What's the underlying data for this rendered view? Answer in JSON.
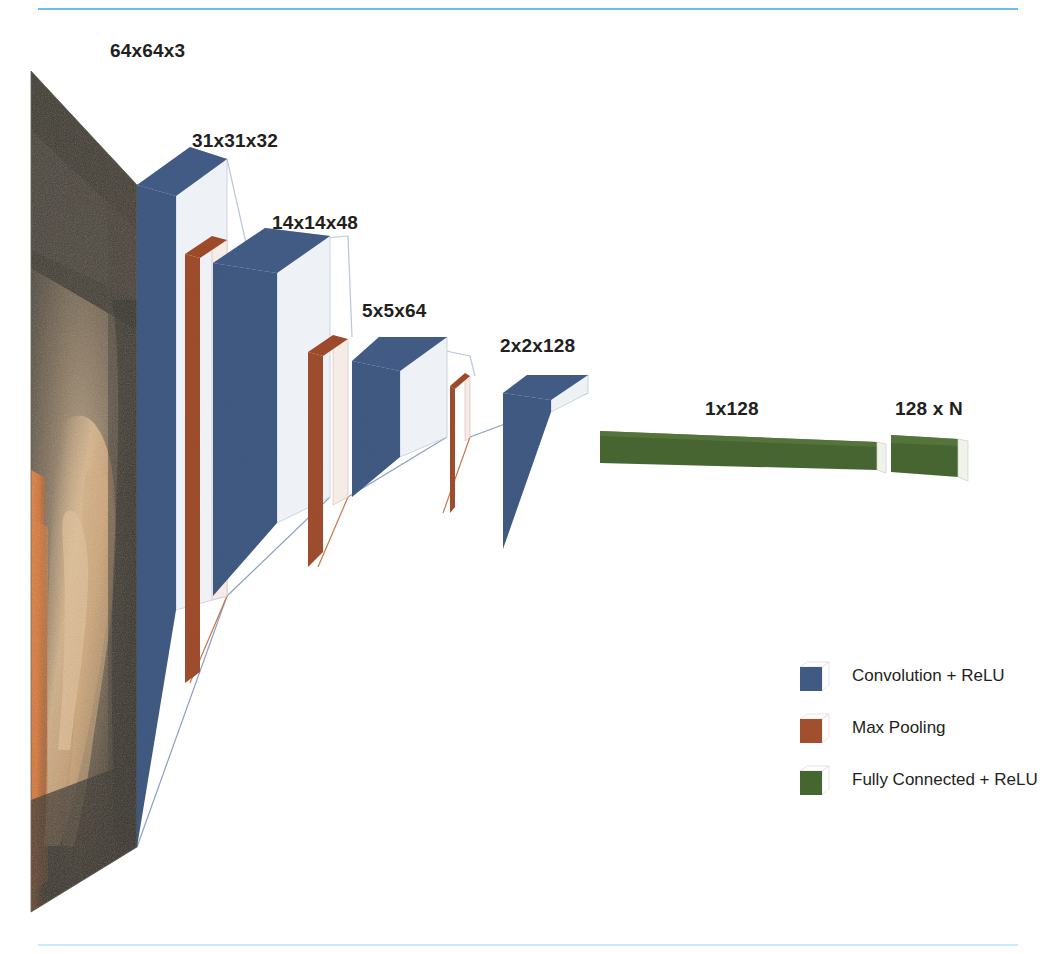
{
  "diagram": {
    "type": "neural-network-architecture",
    "background": "#ffffff",
    "rules": {
      "top_color": "#6dbdf0",
      "bottom_color": "#cdeafb"
    },
    "colors": {
      "convolution": "#3d5780",
      "convolution_dark": "#2f466b",
      "convolution_side": "#eef2f7",
      "pooling": "#9c4a2a",
      "pooling_dark": "#7e3a20",
      "pooling_side": "#f6ece7",
      "fully_connected": "#44632e",
      "fully_connected_dark": "#37511f",
      "fully_connected_side": "#f0f3ec",
      "connector_blue": "#8aa0c4",
      "connector_orange": "#d98f6a",
      "text": "#231f20"
    },
    "input_image": {
      "name": "input-photograph",
      "description": "photographic input plane shown in perspective",
      "palette": [
        "#4a453c",
        "#3b362f",
        "#d8b184",
        "#e8853f",
        "#6a6156",
        "#2b2722"
      ]
    },
    "layers": [
      {
        "id": "input",
        "label": "64x64x3",
        "kind": "input",
        "label_x": 110,
        "label_y": 40
      },
      {
        "id": "conv1",
        "label": "31x31x32",
        "kind": "convolution",
        "label_x": 192,
        "label_y": 130
      },
      {
        "id": "pool1",
        "label": "",
        "kind": "pooling",
        "label_x": 0,
        "label_y": 0
      },
      {
        "id": "conv2",
        "label": "14x14x48",
        "kind": "convolution",
        "label_x": 272,
        "label_y": 212
      },
      {
        "id": "pool2",
        "label": "",
        "kind": "pooling",
        "label_x": 0,
        "label_y": 0
      },
      {
        "id": "conv3",
        "label": "5x5x64",
        "kind": "convolution",
        "label_x": 362,
        "label_y": 300
      },
      {
        "id": "pool3",
        "label": "",
        "kind": "pooling",
        "label_x": 0,
        "label_y": 0
      },
      {
        "id": "conv4",
        "label": "2x2x128",
        "kind": "convolution",
        "label_x": 500,
        "label_y": 335
      },
      {
        "id": "fc1",
        "label": "1x128",
        "kind": "fully_connected",
        "label_x": 705,
        "label_y": 398
      },
      {
        "id": "fc2",
        "label": "128 x N",
        "kind": "fully_connected",
        "label_x": 895,
        "label_y": 398
      }
    ],
    "legend": {
      "items": [
        {
          "label": "Convolution + ReLU",
          "color": "#3d5780",
          "color_dark": "#2f466b"
        },
        {
          "label": "Max Pooling",
          "color": "#9c4a2a",
          "color_dark": "#7e3a20"
        },
        {
          "label": "Fully Connected + ReLU",
          "color": "#44632e",
          "color_dark": "#37511f"
        }
      ]
    }
  }
}
